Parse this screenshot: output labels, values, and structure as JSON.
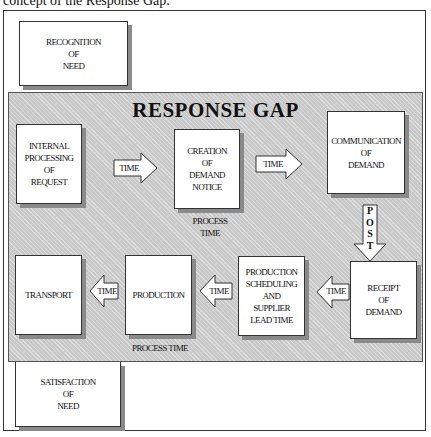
{
  "caption": "concept of the Response Gap.",
  "diagram": {
    "title": "RESPONSE GAP",
    "outer_boxes": {
      "recognition": [
        "RECOGNITION",
        "OF",
        "NEED"
      ],
      "satisfaction": [
        "SATISFACTION",
        "OF",
        "NEED"
      ]
    },
    "process_boxes": {
      "internal": [
        "INTERNAL",
        "PROCESSING",
        "OF",
        "REQUEST"
      ],
      "creation": [
        "CREATION",
        "OF",
        "DEMAND",
        "NOTICE"
      ],
      "communication": [
        "COMMUNICATION",
        "OF",
        "DEMAND"
      ],
      "receipt": [
        "RECEIPT",
        "OF",
        "DEMAND"
      ],
      "scheduling": [
        "PRODUCTION",
        "SCHEDULING",
        "AND",
        "SUPPLIER",
        "LEAD TIME"
      ],
      "production": [
        "PRODUCTION"
      ],
      "transport": [
        "TRANSPORT"
      ]
    },
    "arrows": {
      "time": "TIME",
      "post_letters": [
        "P",
        "O",
        "S",
        "T"
      ]
    },
    "labels": {
      "process_time_top": [
        "PROCESS",
        "TIME"
      ],
      "process_time_bottom": "PROCESS TIME"
    }
  }
}
